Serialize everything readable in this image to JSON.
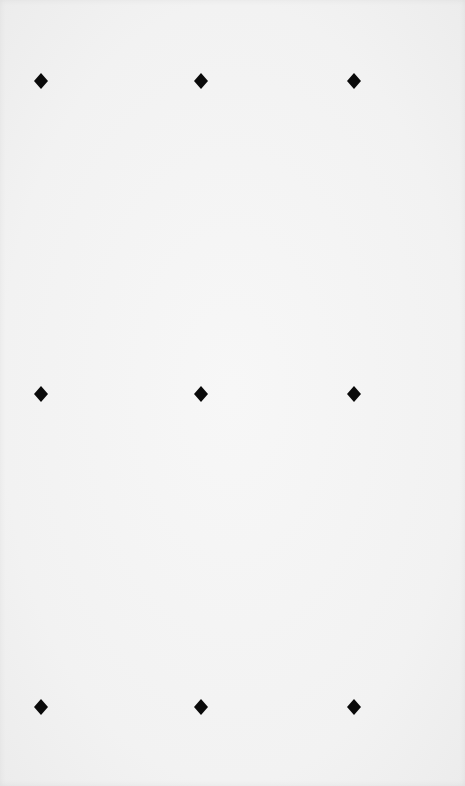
{
  "canvas": {
    "width": 465,
    "height": 786,
    "background": "#f3f3f3"
  },
  "pattern": {
    "shape": "diamond-icon",
    "color": "#0a0a0a",
    "rows": 3,
    "columns": 3,
    "column_x": [
      41,
      201,
      354
    ],
    "row_y": [
      81,
      394,
      707
    ]
  }
}
